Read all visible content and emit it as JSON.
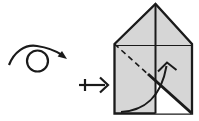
{
  "diagram": {
    "kind": "origami-instruction-step",
    "background_color": "#ffffff",
    "line_color": "#1a1a1a",
    "symbols": {
      "turn_over": {
        "icon": "turn-over-icon",
        "circle_d": "M 27 61 A 10.5 10.5 0 1 0 48 61 A 10.5 10.5 0 1 0 27 61 Z",
        "arc_d": "M 9 65 C 14 52 25 44 37 46 C 47 47.5 56 51 62 55",
        "arrowhead_points_d": "M 67 59 L 57.6 56.5 L 62 51 Z"
      },
      "step_arrow": {
        "icon": "maps-to-arrow-icon",
        "shaft_d": "M 79 85 L 105 85",
        "tick_d": "M 85 79 L 85 91",
        "head_d": "M 100 77.5 L 108 85 L 100 92.5"
      }
    },
    "figure": {
      "name": "house-shaped-paper",
      "paper_color": "#d6d6d6",
      "underside_color": "#ffffff",
      "outline_d": "M 114.5 44 L 155.5 4 L 192 44 L 192 113.5 L 114.5 113.5 Z",
      "eave_crease_d": "M 114.5 45.5 L 192 45.5",
      "underside_triangle_d": "M 155.5 80.8 L 155.5 113.5 L 192 113.5 Z",
      "center_crease_d": "M 155.5 4 L 155.5 113.5",
      "valley_fold_d": "M 114.5 44 L 150 76",
      "folded_edge_d": "M 148 74 L 192 113.5",
      "fold_arrow_d": "M 121 112 C 143 111 161 98 166.5 66",
      "fold_arrowhead_d": "M 158 71.5 L 167 62.5 L 176.5 70"
    }
  }
}
